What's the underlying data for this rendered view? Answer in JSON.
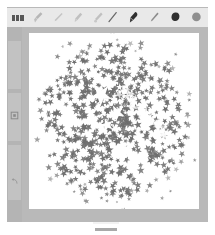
{
  "app": {
    "title": "Paint",
    "window_bg": "#b9b9b9",
    "page_bg": "#ffffff"
  },
  "toolbar": {
    "bg": "#e9e9e9",
    "menu_label": "menu-logo",
    "left_tools": [
      {
        "name": "brush-tool",
        "icon": "brush-icon",
        "color": "#b6b6b6",
        "active": false
      },
      {
        "name": "pen-tool",
        "icon": "pen-icon",
        "color": "#c4c4c4",
        "active": false
      },
      {
        "name": "marker-tool",
        "icon": "marker-icon",
        "color": "#c0c0c0",
        "active": false
      },
      {
        "name": "calligraphy-tool",
        "icon": "calligraphy-icon",
        "color": "#c0c0c0",
        "active": false
      }
    ],
    "right_tools": [
      {
        "name": "line-stroke-tool",
        "icon": "diagonal-stroke-icon",
        "color": "#6a6a6a",
        "active": false
      },
      {
        "name": "dark-marker-tool",
        "icon": "marker-filled-icon",
        "color": "#2f2f2f",
        "active": true
      },
      {
        "name": "light-pen-tool",
        "icon": "pen-outline-icon",
        "color": "#8c8c8c",
        "active": false
      },
      {
        "name": "blob-brush-tool",
        "icon": "blob-icon",
        "color": "#2f2f2f",
        "active": false
      },
      {
        "name": "color-swatch",
        "icon": "circle-icon",
        "color": "#8f8f8f",
        "active": false
      }
    ]
  },
  "sidebar": {
    "bg": "#b4b4b4",
    "panel_bg": "#c2c2c2",
    "items": [
      {
        "name": "sidebar-item-shape",
        "icon": "shape-square-icon",
        "color": "#8a8a8a"
      },
      {
        "name": "sidebar-item-undo",
        "icon": "undo-arrow-icon",
        "color": "#9a9a9a"
      }
    ]
  },
  "canvas": {
    "bg": "#ffffff",
    "width": 170,
    "height": 176,
    "artwork": {
      "name": "star-spray-splatter",
      "description": "Dense circular spray of small five-pointed stars",
      "fill_color": "#6e6e6e",
      "center_x": 85,
      "center_y": 88,
      "radius": 72,
      "star_count": 520,
      "star_size_min": 2.2,
      "star_size_max": 5.0,
      "highlight_stars": [
        {
          "x": 72,
          "y": 62,
          "size": 11.5
        },
        {
          "x": 88,
          "y": 80,
          "size": 8.5
        },
        {
          "x": 78,
          "y": 92,
          "size": 7.0
        },
        {
          "x": 96,
          "y": 118,
          "size": 10.0
        },
        {
          "x": 104,
          "y": 130,
          "size": 6.0
        }
      ],
      "seed": 20240617
    }
  },
  "bottom": {
    "mark_name": "scroll-indicator",
    "mark_color": "#a9a9a9"
  }
}
